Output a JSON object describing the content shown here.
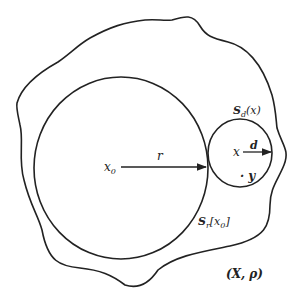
{
  "diagram": {
    "type": "metric-space-balls",
    "stroke_color": "#222222",
    "background": "#ffffff",
    "space": {
      "label": "(X, ρ)"
    },
    "big_ball": {
      "label_S": "S",
      "label_sub": "r",
      "label_arg": "[x",
      "label_arg_sub": "0",
      "label_close": "]",
      "center_label": "x",
      "center_sub": "0",
      "radius_label": "r"
    },
    "small_ball": {
      "label_S": "S",
      "label_sub": "d",
      "label_arg": "(x)",
      "center_label": "x",
      "radius_label": "d",
      "point_label": "· y"
    }
  }
}
